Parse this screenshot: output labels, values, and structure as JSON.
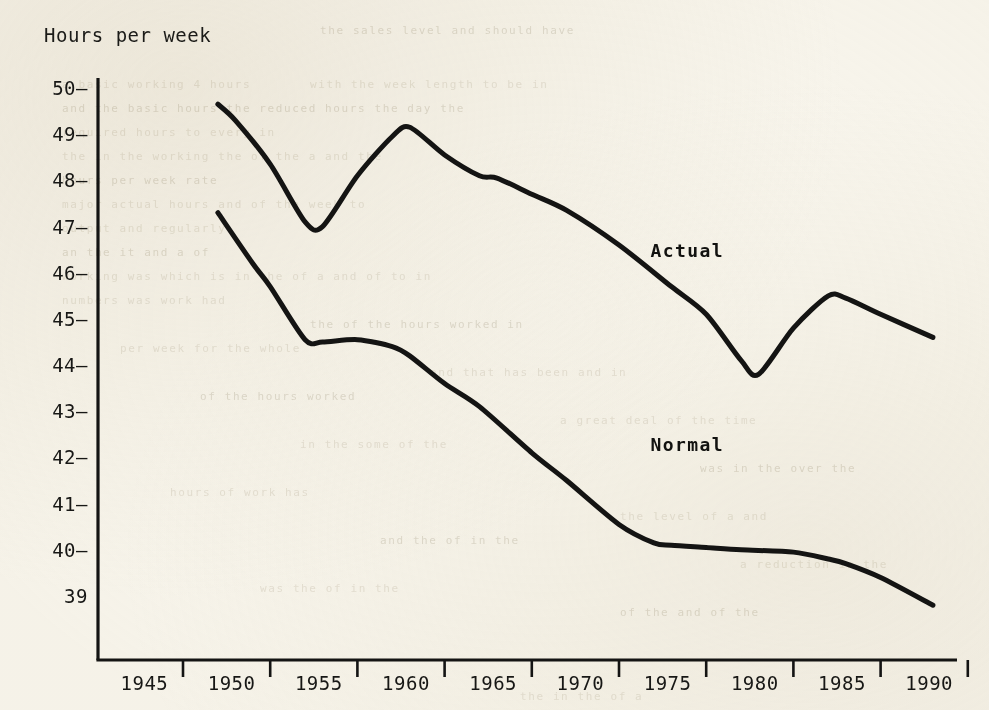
{
  "figure": {
    "background_color": "#faf8f1",
    "ink_color": "#141413",
    "ylabel": "Hours per week"
  },
  "chart_data": {
    "type": "line",
    "title": "",
    "subtitle": "",
    "xlabel": "",
    "ylabel": "Hours per week",
    "xlim": [
      1943,
      1992
    ],
    "ylim": [
      38.5,
      50.4
    ],
    "grid": false,
    "legend_position": "inline-annotation",
    "xticks": [
      1945,
      1950,
      1955,
      1960,
      1965,
      1970,
      1975,
      1980,
      1985,
      1990
    ],
    "xtick_labels": [
      "1945",
      "1950",
      "1955",
      "1960",
      "1965",
      "1970",
      "1975",
      "1980",
      "1985",
      "1990"
    ],
    "yticks": [
      50,
      49,
      48,
      47,
      46,
      45,
      44,
      43,
      42,
      41,
      40,
      39
    ],
    "ytick_labels": [
      "50",
      "49",
      "48",
      "47",
      "46",
      "45",
      "44",
      "43",
      "42",
      "41",
      "40",
      "39"
    ],
    "annotations": [
      {
        "text": "Actual",
        "x": 1972.5,
        "y": 46.5
      },
      {
        "text": "Normal",
        "x": 1972.5,
        "y": 42.3
      }
    ],
    "series": [
      {
        "name": "Actual",
        "color": "#141413",
        "x": [
          1947,
          1948,
          1950,
          1952,
          1953,
          1955,
          1957,
          1958,
          1960,
          1962,
          1963,
          1965,
          1967,
          1970,
          1973,
          1975,
          1977,
          1978,
          1980,
          1982,
          1983,
          1985,
          1988
        ],
        "values": [
          49.65,
          49.3,
          48.35,
          47.1,
          47.0,
          48.1,
          48.95,
          49.15,
          48.55,
          48.1,
          48.05,
          47.7,
          47.35,
          46.6,
          45.7,
          45.1,
          44.1,
          43.8,
          44.8,
          45.5,
          45.45,
          45.1,
          44.6
        ]
      },
      {
        "name": "Normal",
        "color": "#141413",
        "x": [
          1947,
          1949,
          1950,
          1952,
          1953,
          1955,
          1957,
          1958,
          1960,
          1962,
          1965,
          1967,
          1970,
          1972,
          1973,
          1975,
          1977,
          1980,
          1982,
          1983,
          1985,
          1988
        ],
        "values": [
          47.3,
          46.2,
          45.7,
          44.55,
          44.5,
          44.55,
          44.4,
          44.2,
          43.6,
          43.1,
          42.1,
          41.5,
          40.55,
          40.15,
          40.1,
          40.05,
          40.0,
          39.95,
          39.8,
          39.7,
          39.4,
          38.8
        ]
      }
    ]
  },
  "axes": {
    "y_axis_name": "hours-per-week-axis",
    "x_axis_name": "year-axis"
  },
  "bleed_through_lines": [
    {
      "text": "the sales level  and  should have",
      "x": 320,
      "y": 24
    },
    {
      "text": "a basic working 4 hours",
      "x": 62,
      "y": 78
    },
    {
      "text": "with the week length to  be  in",
      "x": 310,
      "y": 78
    },
    {
      "text": "and  the basic hours the   reduced  hours  the  day  the",
      "x": 62,
      "y": 102
    },
    {
      "text": "required hours  to  every  in",
      "x": 62,
      "y": 126
    },
    {
      "text": "the  in  the  working   the  of  the  a  and  the",
      "x": 62,
      "y": 150
    },
    {
      "text": "hours  per  week  rate",
      "x": 62,
      "y": 174
    },
    {
      "text": "major  actual  hours  and  of   the  week  to",
      "x": 62,
      "y": 198
    },
    {
      "text": "output  and  regularly",
      "x": 62,
      "y": 222
    },
    {
      "text": "an  the  it  and  a  of",
      "x": 62,
      "y": 246
    },
    {
      "text": "working  was  which  is   in the  of  a  and  of  to  in",
      "x": 62,
      "y": 270
    },
    {
      "text": "numbers  was  work  had",
      "x": 62,
      "y": 294
    },
    {
      "text": "the  of  the  hours  worked  in",
      "x": 310,
      "y": 318
    },
    {
      "text": "per  week  for  the  whole",
      "x": 120,
      "y": 342
    },
    {
      "text": "and  that  has  been  and  in",
      "x": 430,
      "y": 366
    },
    {
      "text": "of  the  hours  worked",
      "x": 200,
      "y": 390
    },
    {
      "text": "a  great  deal  of  the  time",
      "x": 560,
      "y": 414
    },
    {
      "text": "in  the  some  of  the",
      "x": 300,
      "y": 438
    },
    {
      "text": "was  in  the  over  the",
      "x": 700,
      "y": 462
    },
    {
      "text": "hours  of  work  has",
      "x": 170,
      "y": 486
    },
    {
      "text": "the  level  of  a  and",
      "x": 620,
      "y": 510
    },
    {
      "text": "and  the  of  in  the",
      "x": 380,
      "y": 534
    },
    {
      "text": "a  reduction  in  the",
      "x": 740,
      "y": 558
    },
    {
      "text": "was  the  of  in  the",
      "x": 260,
      "y": 582
    },
    {
      "text": "of  the  and  of  the",
      "x": 620,
      "y": 606
    },
    {
      "text": "the  in  the  of  a",
      "x": 520,
      "y": 690
    }
  ]
}
